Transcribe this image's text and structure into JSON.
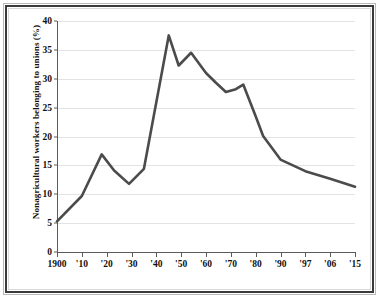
{
  "chart_data": {
    "type": "line",
    "title": "",
    "xlabel": "",
    "ylabel": "Nonagricultural workers belonging to unions (%)",
    "ylim": [
      0,
      40
    ],
    "ytick_step": 5,
    "grid": true,
    "legend_position": "none",
    "line_color": "#4b4b4b",
    "gridline_color": "#e3e3e3",
    "axis_color": "#5b5b5b",
    "tick_labels": {
      "y": [
        "0",
        "5",
        "10",
        "15",
        "20",
        "25",
        "30",
        "35",
        "40"
      ],
      "x": [
        "1900",
        "'10",
        "'20",
        "'30",
        "'40",
        "'50",
        "'60",
        "'70",
        "'80",
        "'90",
        "'97",
        "'06",
        "'15"
      ]
    },
    "x_positions": [
      1900,
      1910,
      1920,
      1930,
      1940,
      1950,
      1960,
      1970,
      1980,
      1990,
      1997,
      2006,
      2015
    ],
    "categories": [
      1900,
      1910,
      1918,
      1923,
      1929,
      1935,
      1945,
      1949,
      1954,
      1960,
      1964,
      1968,
      1972,
      1975,
      1980,
      1983,
      1990,
      1997,
      2006,
      2015
    ],
    "values": [
      5.3,
      9.7,
      16.9,
      14.1,
      11.8,
      14.4,
      37.5,
      32.3,
      34.5,
      31.0,
      29.3,
      27.7,
      28.2,
      29.0,
      23.5,
      20.1,
      16.0,
      14.0,
      12.7,
      11.3
    ],
    "series": [
      {
        "name": "Nonagricultural workers belonging to unions (%)",
        "points": [
          {
            "x": 1900,
            "y": 5.3
          },
          {
            "x": 1910,
            "y": 9.7
          },
          {
            "x": 1918,
            "y": 16.9
          },
          {
            "x": 1923,
            "y": 14.1
          },
          {
            "x": 1929,
            "y": 11.8
          },
          {
            "x": 1935,
            "y": 14.4
          },
          {
            "x": 1945,
            "y": 37.5
          },
          {
            "x": 1949,
            "y": 32.3
          },
          {
            "x": 1954,
            "y": 34.5
          },
          {
            "x": 1960,
            "y": 31.0
          },
          {
            "x": 1964,
            "y": 29.3
          },
          {
            "x": 1968,
            "y": 27.7
          },
          {
            "x": 1972,
            "y": 28.2
          },
          {
            "x": 1975,
            "y": 29.0
          },
          {
            "x": 1980,
            "y": 23.5
          },
          {
            "x": 1983,
            "y": 20.1
          },
          {
            "x": 1990,
            "y": 16.0
          },
          {
            "x": 1997,
            "y": 14.0
          },
          {
            "x": 2006,
            "y": 12.7
          },
          {
            "x": 2015,
            "y": 11.3
          }
        ]
      }
    ]
  }
}
